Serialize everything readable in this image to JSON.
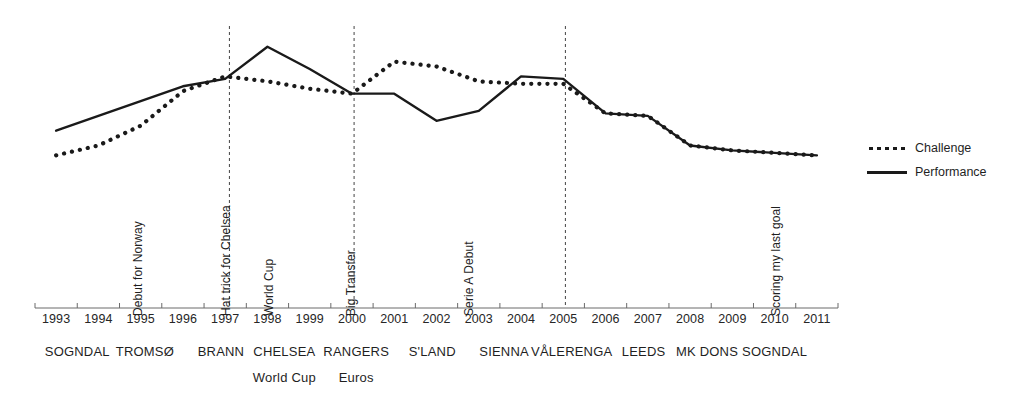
{
  "chart_data": {
    "type": "line",
    "title": "",
    "xlabel": "",
    "ylabel": "",
    "grid": false,
    "legend_position": "right",
    "xlim": [
      1993,
      2011
    ],
    "ylim": [
      0,
      100
    ],
    "x": [
      1993,
      1994,
      1995,
      1996,
      1997,
      1998,
      1999,
      2000,
      2001,
      2002,
      2003,
      2004,
      2005,
      2006,
      2007,
      2008,
      2009,
      2010,
      2011
    ],
    "categories": [
      "1993",
      "1994",
      "1995",
      "1996",
      "1997",
      "1998",
      "1999",
      "2000",
      "2001",
      "2002",
      "2003",
      "2004",
      "2005",
      "2006",
      "2007",
      "2008",
      "2009",
      "2010",
      "2011"
    ],
    "series": [
      {
        "name": "Challenge",
        "style": "dotted",
        "color": "#1a1a1a",
        "values": [
          40,
          44,
          52,
          66,
          72,
          70,
          67,
          65,
          78,
          76,
          70,
          69,
          69,
          57,
          56,
          44,
          42,
          41,
          40
        ]
      },
      {
        "name": "Performance",
        "style": "solid",
        "color": "#1a1a1a",
        "values": [
          50,
          56,
          62,
          68,
          71,
          84,
          75,
          65,
          65,
          54,
          58,
          72,
          71,
          57,
          56,
          44,
          42,
          41,
          40
        ]
      }
    ]
  },
  "legend": {
    "items": [
      {
        "label": "Challenge",
        "style": "dotted"
      },
      {
        "label": "Performance",
        "style": "solid"
      }
    ]
  },
  "axis": {
    "years": [
      "1993",
      "1994",
      "1995",
      "1996",
      "1997",
      "1998",
      "1999",
      "2000",
      "2001",
      "2002",
      "2003",
      "2004",
      "2005",
      "2006",
      "2007",
      "2008",
      "2009",
      "2010",
      "2011"
    ]
  },
  "clubs": [
    {
      "label": "SOGNDAL",
      "x": 1993.5,
      "sub": null
    },
    {
      "label": "TROMSØ",
      "x": 1995.1,
      "sub": null
    },
    {
      "label": "BRANN",
      "x": 1996.9,
      "sub": null
    },
    {
      "label": "CHELSEA",
      "x": 1998.4,
      "sub": "World Cup"
    },
    {
      "label": "RANGERS",
      "x": 2000.1,
      "sub": "Euros"
    },
    {
      "label": "S'LAND",
      "x": 2001.9,
      "sub": null
    },
    {
      "label": "SIENNA",
      "x": 2003.6,
      "sub": null
    },
    {
      "label": "VÅLERENGA",
      "x": 2005.2,
      "sub": null
    },
    {
      "label": "LEEDS",
      "x": 2006.9,
      "sub": null
    },
    {
      "label": "MK DONS",
      "x": 2008.4,
      "sub": null
    },
    {
      "label": "SOGNDAL",
      "x": 2010.0,
      "sub": null
    }
  ],
  "club_sub_labels": [
    {
      "label": "World Cup",
      "x": 1998.4
    },
    {
      "label": "Euros",
      "x": 2000.1
    }
  ],
  "events": [
    {
      "label": "Debut for Norway",
      "x": 1995.0,
      "marker_line": false
    },
    {
      "label": "Hat trick for Chelsea",
      "x": 1997.1,
      "marker_line": true
    },
    {
      "label": "World Cup",
      "x": 1998.1,
      "marker_line": false
    },
    {
      "label": "Big Transfer",
      "x": 2000.05,
      "marker_line": true
    },
    {
      "label": "Serie A Debut",
      "x": 2002.85,
      "marker_line": false
    },
    {
      "label": "Scoring my last goal",
      "x": 2010.1,
      "marker_line": false
    }
  ],
  "marker_lines": [
    {
      "x": 1997.1,
      "label": "Hat trick for Chelsea"
    },
    {
      "x": 2000.05,
      "label": "Big Transfer"
    },
    {
      "x": 2005.05,
      "label": ""
    }
  ]
}
